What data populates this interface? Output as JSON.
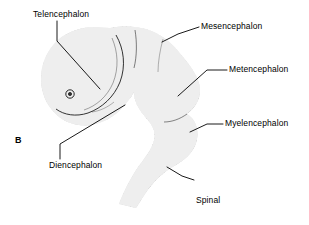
{
  "figure": {
    "panel_letter": "B",
    "background_color": "#ffffff",
    "line_color": "#000000",
    "fill_color": "#e8e8e8",
    "stipple_color": "#1a1a1a",
    "width": 309,
    "height": 225
  },
  "labels": [
    {
      "id": "telencephalon",
      "text": "Telencephalon",
      "leader": "vertical-then-diagonal",
      "anchor_x": 68,
      "anchor_y": 42
    },
    {
      "id": "mesencephalon",
      "text": "Mesencephalon",
      "leader": "diagonal-down-left",
      "anchor_x": 163,
      "anchor_y": 41
    },
    {
      "id": "metencephalon",
      "text": "Metencephalon",
      "leader": "horizontal-then-diagonal",
      "anchor_x": 178,
      "anchor_y": 96
    },
    {
      "id": "myelencephalon",
      "text": "Myelencephalon",
      "leader": "horizontal-then-diagonal",
      "anchor_x": 190,
      "anchor_y": 131
    },
    {
      "id": "spinal-cord",
      "text": "Spinal\ncord",
      "line1": "Spinal",
      "line2": "cord",
      "leader": "diagonal-up-left",
      "anchor_x": 168,
      "anchor_y": 167
    },
    {
      "id": "diencephalon",
      "text": "Diencephalon",
      "leader": "vertical-then-diagonal",
      "anchor_x": 125,
      "anchor_y": 105
    }
  ]
}
